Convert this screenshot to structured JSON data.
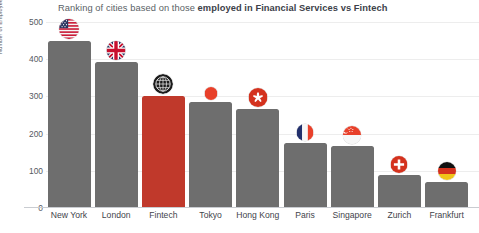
{
  "chart_data": {
    "type": "bar",
    "title": "Ranking of cities based on those employed in Financial Services vs Fintech",
    "title_regular": "Ranking of cities based on those ",
    "title_bold": "employed in Financial Services vs Fintech",
    "xlabel": "",
    "ylabel": "Number of Employees in Financial Services (thousand)",
    "ylim": [
      0,
      500
    ],
    "yticks": [
      500,
      400,
      300,
      200,
      100,
      0
    ],
    "grid": true,
    "legend": "none",
    "categories": [
      "New York",
      "London",
      "Fintech",
      "Tokyo",
      "Hong Kong",
      "Paris",
      "Singapore",
      "Zurich",
      "Frankfurt"
    ],
    "values": [
      450,
      392,
      300,
      284,
      266,
      174,
      167,
      90,
      70
    ],
    "highlight_category": "Fintech",
    "bar_color": "#6e6e6e",
    "highlight_color": "#c0392b",
    "icons": [
      {
        "name": "flag-united-states-icon",
        "category": "New York"
      },
      {
        "name": "flag-united-kingdom-icon",
        "category": "London"
      },
      {
        "name": "fintech-globe-icon",
        "category": "Fintech"
      },
      {
        "name": "flag-japan-icon",
        "category": "Tokyo"
      },
      {
        "name": "flag-hong-kong-icon",
        "category": "Hong Kong"
      },
      {
        "name": "flag-france-icon",
        "category": "Paris"
      },
      {
        "name": "flag-singapore-icon",
        "category": "Singapore"
      },
      {
        "name": "flag-switzerland-icon",
        "category": "Zurich"
      },
      {
        "name": "flag-germany-icon",
        "category": "Frankfurt"
      }
    ]
  },
  "colors": {
    "background": "#ffffff",
    "text": "#3f444b",
    "muted_text": "#55595f",
    "grid": "#ededed",
    "axis": "#c9ccd1"
  }
}
